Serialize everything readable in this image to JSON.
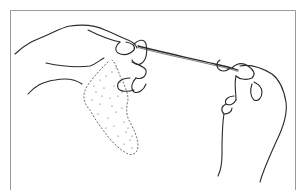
{
  "illustration": {
    "subject": "hands-pulling-yarn-from-fleece",
    "colors": {
      "background": "#ffffff",
      "line": "#2a2a2a",
      "border": "#9a9a9a",
      "stipple": "#555555"
    }
  }
}
